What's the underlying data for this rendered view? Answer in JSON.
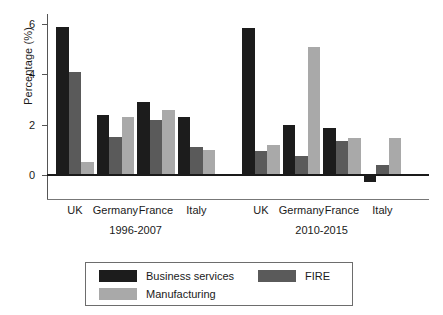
{
  "chart_data": {
    "type": "bar",
    "title": "",
    "subtitle": "",
    "xlabel": "",
    "ylabel": "Percentage (%)",
    "ylim": [
      -1,
      6.4
    ],
    "yticks": [
      0,
      2,
      4,
      6
    ],
    "ytick_labels": [
      "0",
      "2",
      "4",
      "6"
    ],
    "grid": false,
    "legend_position": "bottom",
    "categories": [
      "UK",
      "Germany",
      "France",
      "Italy",
      "UK",
      "Germany",
      "France",
      "Italy"
    ],
    "group_labels": [
      "1996-2007",
      "2010-2015"
    ],
    "groups": [
      {
        "period": "1996-2007",
        "countries": [
          "UK",
          "Germany",
          "France",
          "Italy"
        ],
        "Business services": [
          5.9,
          2.4,
          2.9,
          2.3
        ],
        "FIRE": [
          4.1,
          1.5,
          2.2,
          1.1
        ],
        "Manufacturing": [
          0.5,
          2.3,
          2.6,
          1.0
        ]
      },
      {
        "period": "2010-2015",
        "countries": [
          "UK",
          "Germany",
          "France",
          "Italy"
        ],
        "Business services": [
          5.85,
          2.0,
          1.85,
          -0.3
        ],
        "FIRE": [
          0.95,
          0.75,
          1.35,
          0.4
        ],
        "Manufacturing": [
          1.2,
          5.1,
          1.45,
          1.45
        ]
      }
    ],
    "series": [
      {
        "name": "Business services",
        "color": "#1c1c1c",
        "values": [
          5.9,
          2.4,
          2.9,
          2.3,
          5.85,
          2.0,
          1.85,
          -0.3
        ]
      },
      {
        "name": "FIRE",
        "color": "#5a5a5a",
        "values": [
          4.1,
          1.5,
          2.2,
          1.1,
          0.95,
          0.75,
          1.35,
          0.4
        ]
      },
      {
        "name": "Manufacturing",
        "color": "#a9a9a9",
        "values": [
          0.5,
          2.3,
          2.6,
          1.0,
          1.2,
          5.1,
          1.45,
          1.45
        ]
      }
    ]
  },
  "axis": {
    "y_label": "Percentage (%)",
    "tick_0": "0",
    "tick_2": "2",
    "tick_4": "4",
    "tick_6": "6"
  },
  "xaxis": {
    "labels": [
      {
        "text": "UK"
      },
      {
        "text": "Germany"
      },
      {
        "text": "France"
      },
      {
        "text": "Italy"
      },
      {
        "text": "UK"
      },
      {
        "text": "Germany"
      },
      {
        "text": "France"
      },
      {
        "text": "Italy"
      }
    ],
    "periods": [
      {
        "text": "1996-2007"
      },
      {
        "text": "2010-2015"
      }
    ]
  },
  "legend": {
    "items": [
      {
        "label": "Business services",
        "color": "#1c1c1c"
      },
      {
        "label": "FIRE",
        "color": "#5a5a5a"
      },
      {
        "label": "Manufacturing",
        "color": "#a9a9a9"
      }
    ]
  },
  "colors": {
    "business_services": "#1c1c1c",
    "fire": "#5a5a5a",
    "manufacturing": "#a9a9a9",
    "axis": "#555555",
    "zero_line": "#1a1a1a",
    "legend_border": "#6d6d6d",
    "background": "#ffffff"
  }
}
